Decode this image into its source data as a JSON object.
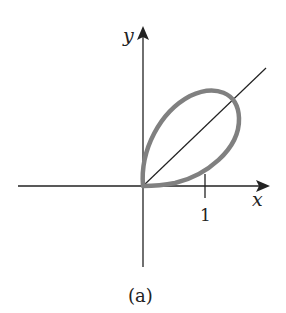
{
  "figure": {
    "caption": "(a)",
    "x_axis_label": "x",
    "y_axis_label": "y",
    "x_tick_label": "1",
    "curve_color": "#808080",
    "axis_color": "#222222"
  }
}
